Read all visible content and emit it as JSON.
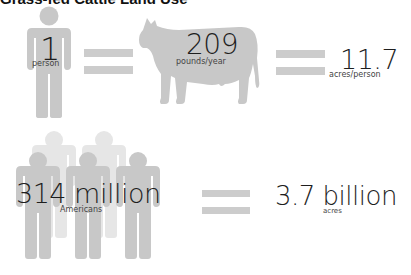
{
  "title": "Grass-fed Cattle Land Use",
  "row1": {
    "person": {
      "value": "1",
      "unit": "person"
    },
    "cow": {
      "value": "209",
      "unit": "pounds/year"
    },
    "result": {
      "value": "11.7",
      "unit": "acres/person"
    }
  },
  "row2": {
    "people": {
      "value": "314 million",
      "unit": "Americans"
    },
    "result": {
      "value": "3.7 billion",
      "unit": "acres"
    }
  },
  "colors": {
    "icon_gray": "#c8c8c8",
    "icon_light": "#e6e6e6",
    "equals_bar": "#cccccc",
    "text": "#1e1e1e"
  }
}
